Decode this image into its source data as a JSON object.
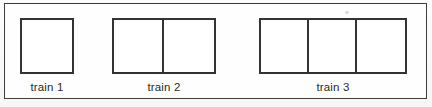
{
  "figure": {
    "kind": "train-sequence-diagram",
    "background_color": "#fbfbfa",
    "frame_color": "#3d3d3d",
    "box_color": "#333333",
    "text_color": "#2a2a2a",
    "trains": [
      {
        "label": "train 1",
        "car_count": 1,
        "left": 15,
        "top": 14,
        "width": 54,
        "car_width": 54
      },
      {
        "label": "train 2",
        "car_count": 2,
        "left": 107,
        "top": 14,
        "width": 104,
        "car_width": 52
      },
      {
        "label": "train 3",
        "car_count": 3,
        "left": 254,
        "top": 14,
        "width": 148,
        "car_width": 49
      }
    ]
  }
}
